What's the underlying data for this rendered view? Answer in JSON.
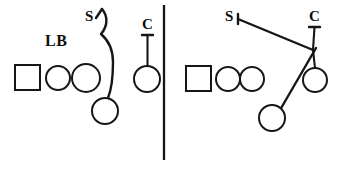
{
  "diagram": {
    "background_color": "#ffffff",
    "ink_color": "#161616",
    "panels": [
      {
        "id": "left",
        "name": "left-panel",
        "labels": [
          {
            "id": "lb",
            "text": "LB",
            "x": 57,
            "y": 45
          },
          {
            "id": "s",
            "text": "S",
            "x": 91,
            "y": 20
          },
          {
            "id": "c",
            "text": "C",
            "x": 144,
            "y": 28
          }
        ],
        "players": [
          {
            "id": "box-1",
            "shape": "square",
            "x": 15,
            "y": 65,
            "w": 25,
            "h": 25
          },
          {
            "id": "circle-1",
            "shape": "circle",
            "cx": 58,
            "cy": 78,
            "r": 12
          },
          {
            "id": "circle-2",
            "shape": "circle",
            "cx": 86,
            "cy": 78,
            "r": 14
          },
          {
            "id": "circle-3",
            "shape": "circle",
            "cx": 105,
            "cy": 111,
            "r": 13
          },
          {
            "id": "circle-4",
            "shape": "circle",
            "cx": 147,
            "cy": 79,
            "r": 13
          }
        ],
        "routes": [
          {
            "id": "safety-curl",
            "type": "curve",
            "from": "circle-3",
            "to": "s"
          },
          {
            "id": "corner-drop",
            "type": "line",
            "from": "c",
            "to": "circle-4"
          }
        ]
      },
      {
        "id": "right",
        "name": "right-panel",
        "labels": [
          {
            "id": "s",
            "text": "S",
            "x": 231,
            "y": 20
          },
          {
            "id": "c",
            "text": "C",
            "x": 312,
            "y": 19
          }
        ],
        "players": [
          {
            "id": "box-1",
            "shape": "square",
            "x": 186,
            "y": 66,
            "w": 25,
            "h": 25
          },
          {
            "id": "circle-1",
            "shape": "circle",
            "cx": 228,
            "cy": 79,
            "r": 12
          },
          {
            "id": "circle-2",
            "shape": "circle",
            "cx": 252,
            "cy": 79,
            "r": 12
          },
          {
            "id": "circle-3",
            "shape": "circle",
            "cx": 272,
            "cy": 118,
            "r": 13
          },
          {
            "id": "circle-4",
            "shape": "circle",
            "cx": 315,
            "cy": 80,
            "r": 12
          }
        ],
        "routes": [
          {
            "id": "safety-run",
            "type": "line",
            "from": "junction",
            "to": "s"
          },
          {
            "id": "corner-drop",
            "type": "line",
            "from": "c",
            "to": "junction"
          },
          {
            "id": "junction-to-circle",
            "type": "line",
            "from": "junction",
            "to": "circle-4"
          },
          {
            "id": "junction-to-flat",
            "type": "line",
            "from": "junction",
            "to": "circle-3"
          }
        ],
        "junction": {
          "x": 313,
          "y": 50
        }
      }
    ],
    "divider": {
      "x": 164,
      "y1": 5,
      "y2": 160
    }
  }
}
